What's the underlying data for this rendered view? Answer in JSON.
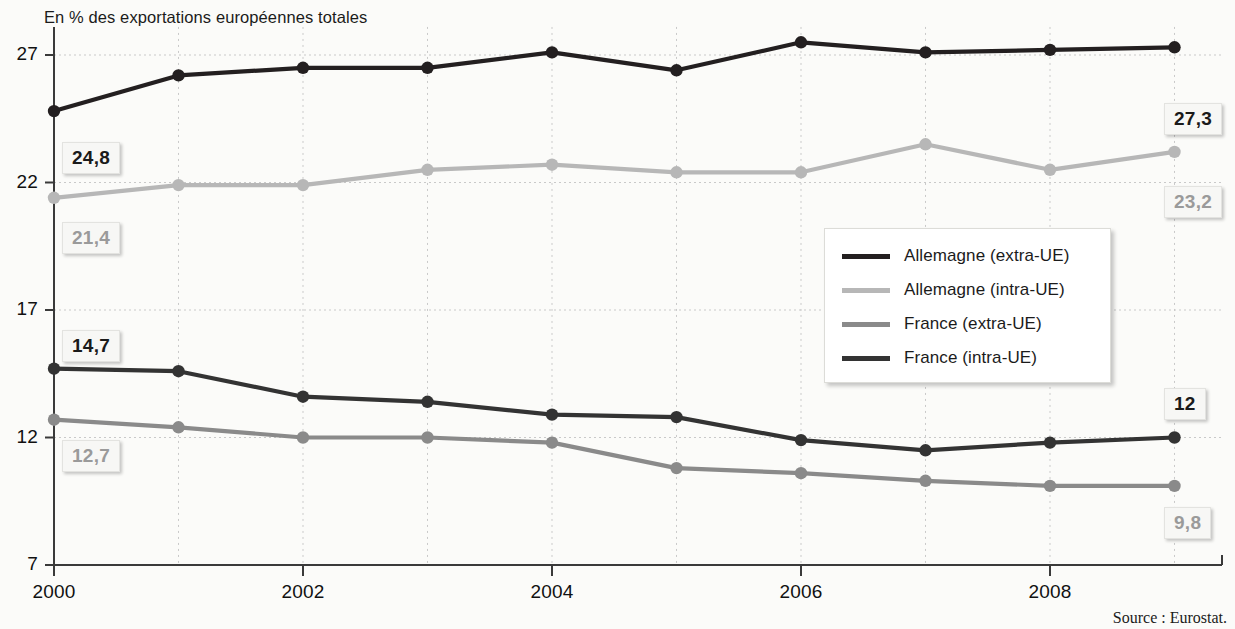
{
  "title": "En % des exportations européennes totales",
  "source": "Source : Eurostat.",
  "colors": {
    "series_dark": "#231f20",
    "series_dark_alt": "#111111",
    "series_light_grey": "#b7b7b7",
    "series_mid_grey": "#8a8a8a",
    "grid": "#c9c9c9",
    "axis": "#3a3a3a",
    "background": "#fbfbf9",
    "callout_dark_text": "#1a1a1a",
    "callout_grey_text": "#9a9a9a"
  },
  "legend": {
    "position": "inside-right-middle",
    "entries": [
      {
        "label": "Allemagne (extra-UE)",
        "color": "#231f20",
        "width": 5
      },
      {
        "label": "Allemagne (intra-UE)",
        "color": "#b7b7b7",
        "width": 5
      },
      {
        "label": "France (extra-UE)",
        "color": "#8a8a8a",
        "width": 5
      },
      {
        "label": "France (intra-UE)",
        "color": "#333333",
        "width": 5
      }
    ]
  },
  "callouts": [
    {
      "name": "allemagne-extra-start",
      "text": "24,8",
      "style": "dark",
      "x": 62,
      "y": 142
    },
    {
      "name": "allemagne-intra-start",
      "text": "21,4",
      "style": "grey",
      "x": 62,
      "y": 222
    },
    {
      "name": "france-intra-start",
      "text": "14,7",
      "style": "dark",
      "x": 62,
      "y": 330
    },
    {
      "name": "france-extra-start",
      "text": "12,7",
      "style": "grey",
      "x": 62,
      "y": 440
    },
    {
      "name": "allemagne-extra-end",
      "text": "27,3",
      "style": "dark",
      "x": 1164,
      "y": 103
    },
    {
      "name": "allemagne-intra-end",
      "text": "23,2",
      "style": "grey",
      "x": 1164,
      "y": 186
    },
    {
      "name": "france-intra-end",
      "text": "12",
      "style": "dark",
      "x": 1164,
      "y": 388
    },
    {
      "name": "france-extra-end",
      "text": "9,8",
      "style": "grey",
      "x": 1164,
      "y": 507
    }
  ],
  "chart_data": {
    "type": "line",
    "title": "En % des exportations européennes totales",
    "xlabel": "",
    "ylabel": "En % des exportations européennes totales",
    "x": [
      2000,
      2001,
      2002,
      2003,
      2004,
      2005,
      2006,
      2007,
      2008,
      2009
    ],
    "xtick_labels": [
      "2000",
      "2002",
      "2004",
      "2006",
      "2008"
    ],
    "xticks": [
      2000,
      2002,
      2004,
      2006,
      2008
    ],
    "xlim": [
      2000,
      2009
    ],
    "ytick_labels": [
      "7",
      "12",
      "17",
      "22",
      "27"
    ],
    "yticks": [
      7,
      12,
      17,
      22,
      27
    ],
    "ylim": [
      7,
      28
    ],
    "grid": true,
    "grid_style": "dotted",
    "legend_position": "center right",
    "series": [
      {
        "name": "Allemagne (extra-UE)",
        "color": "#231f20",
        "values": [
          24.8,
          26.2,
          26.5,
          26.5,
          27.1,
          26.4,
          27.5,
          27.1,
          27.2,
          27.3
        ]
      },
      {
        "name": "Allemagne (intra-UE)",
        "color": "#b7b7b7",
        "values": [
          21.4,
          21.9,
          21.9,
          22.5,
          22.7,
          22.4,
          22.4,
          23.5,
          22.5,
          23.2
        ]
      },
      {
        "name": "France (extra-UE)",
        "color": "#8a8a8a",
        "values": [
          12.7,
          12.4,
          12.0,
          12.0,
          11.8,
          10.8,
          10.6,
          10.3,
          10.1,
          10.1
        ]
      },
      {
        "name": "France (intra-UE)",
        "color": "#333333",
        "values": [
          14.7,
          14.6,
          13.6,
          13.4,
          12.9,
          12.8,
          11.9,
          11.5,
          11.8,
          12.0
        ]
      }
    ]
  },
  "axes_geometry": {
    "plot_left": 54,
    "plot_right": 1222,
    "x0_px": 54,
    "x_step_px": 124.5,
    "y27_px": 55,
    "y_per_unit_px": 25.5,
    "y7_px": 565
  }
}
